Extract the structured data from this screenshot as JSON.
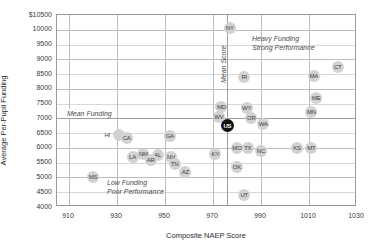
{
  "chart_data": {
    "type": "scatter",
    "title": "",
    "xlabel": "Composite NAEP Score",
    "ylabel": "Average Per-Pupil Funding",
    "xlim": [
      905,
      1030
    ],
    "ylim": [
      4000,
      10500
    ],
    "xticks": [
      910,
      930,
      950,
      970,
      990,
      1010,
      1030
    ],
    "yticks": [
      "$10500",
      "10000",
      "9500",
      "9000",
      "8500",
      "8000",
      "7500",
      "7000",
      "6500",
      "6000",
      "5500",
      "5000",
      "4500",
      "4000"
    ],
    "ytick_values": [
      10500,
      10000,
      9500,
      9000,
      8500,
      8000,
      7500,
      7000,
      6500,
      6000,
      5500,
      5000,
      4500,
      4000
    ],
    "grid": true,
    "legend": "none",
    "mean_funding": 7000,
    "mean_score": 976,
    "annotations": [
      {
        "name": "mean-funding-label",
        "text": "Mean Funding",
        "orientation": "horizontal"
      },
      {
        "name": "mean-score-label",
        "text": "Mean Score",
        "orientation": "vertical"
      },
      {
        "name": "heavy-funding-label",
        "text": "Heavy Funding",
        "orientation": "horizontal"
      },
      {
        "name": "strong-performance-label",
        "text": "Strong Performance",
        "orientation": "horizontal"
      },
      {
        "name": "low-funding-label",
        "text": "Low Funding",
        "orientation": "horizontal"
      },
      {
        "name": "poor-performance-label",
        "text": "Poor Performance",
        "orientation": "horizontal"
      }
    ],
    "points": [
      {
        "label": "NY",
        "x": 977.0,
        "y": 10050,
        "highlight": false,
        "anchor": "center"
      },
      {
        "label": "CT",
        "x": 1022.0,
        "y": 8750,
        "highlight": false,
        "anchor": "center"
      },
      {
        "label": "MA",
        "x": 1012.0,
        "y": 8450,
        "highlight": false,
        "anchor": "center"
      },
      {
        "label": "RI",
        "x": 983.0,
        "y": 8400,
        "highlight": false,
        "anchor": "center"
      },
      {
        "label": "ME",
        "x": 1013.0,
        "y": 7700,
        "highlight": false,
        "anchor": "center"
      },
      {
        "label": "MD",
        "x": 973.5,
        "y": 7400,
        "highlight": false,
        "anchor": "center"
      },
      {
        "label": "WY",
        "x": 984.0,
        "y": 7350,
        "highlight": false,
        "anchor": "center"
      },
      {
        "label": "MN",
        "x": 1011.0,
        "y": 7200,
        "highlight": false,
        "anchor": "center"
      },
      {
        "label": "WV",
        "x": 972.5,
        "y": 7050,
        "highlight": false,
        "anchor": "center"
      },
      {
        "label": "OR",
        "x": 986.0,
        "y": 7000,
        "highlight": false,
        "anchor": "center"
      },
      {
        "label": "US",
        "x": 976.0,
        "y": 6750,
        "highlight": true,
        "anchor": "center"
      },
      {
        "label": "WA",
        "x": 991.0,
        "y": 6800,
        "highlight": false,
        "anchor": "center"
      },
      {
        "label": "HI",
        "x": 931.0,
        "y": 6450,
        "highlight": false,
        "anchor": "left"
      },
      {
        "label": "CA",
        "x": 934.0,
        "y": 6350,
        "highlight": false,
        "anchor": "center"
      },
      {
        "label": "GA",
        "x": 952.0,
        "y": 6400,
        "highlight": false,
        "anchor": "center"
      },
      {
        "label": "MO",
        "x": 980.0,
        "y": 6000,
        "highlight": false,
        "anchor": "center"
      },
      {
        "label": "TX",
        "x": 984.5,
        "y": 6000,
        "highlight": false,
        "anchor": "center"
      },
      {
        "label": "NC",
        "x": 990.0,
        "y": 5900,
        "highlight": false,
        "anchor": "center"
      },
      {
        "label": "KS",
        "x": 1005.0,
        "y": 6000,
        "highlight": false,
        "anchor": "center"
      },
      {
        "label": "MT",
        "x": 1011.0,
        "y": 6000,
        "highlight": false,
        "anchor": "center"
      },
      {
        "label": "KY",
        "x": 971.0,
        "y": 5800,
        "highlight": false,
        "anchor": "center"
      },
      {
        "label": "NM",
        "x": 941.0,
        "y": 5800,
        "highlight": false,
        "anchor": "center"
      },
      {
        "label": "LA",
        "x": 936.5,
        "y": 5700,
        "highlight": false,
        "anchor": "center"
      },
      {
        "label": "AL",
        "x": 947.0,
        "y": 5750,
        "highlight": false,
        "anchor": "center"
      },
      {
        "label": "AR",
        "x": 944.0,
        "y": 5600,
        "highlight": false,
        "anchor": "center"
      },
      {
        "label": "NV",
        "x": 952.5,
        "y": 5700,
        "highlight": false,
        "anchor": "center"
      },
      {
        "label": "TN",
        "x": 954.0,
        "y": 5450,
        "highlight": false,
        "anchor": "center"
      },
      {
        "label": "AZ",
        "x": 958.5,
        "y": 5200,
        "highlight": false,
        "anchor": "center"
      },
      {
        "label": "OK",
        "x": 980.0,
        "y": 5350,
        "highlight": false,
        "anchor": "center"
      },
      {
        "label": "MS",
        "x": 920.0,
        "y": 5000,
        "highlight": false,
        "anchor": "center"
      },
      {
        "label": "UT",
        "x": 983.0,
        "y": 4400,
        "highlight": false,
        "anchor": "center"
      }
    ]
  },
  "colors": {
    "marker": "#d2d2d2",
    "marker_highlight": "#111111",
    "grid": "#d8d8d8",
    "grid_major": "#bdbdbd",
    "axis": "#9a9a9a",
    "text": "#3a3a3a",
    "annotation": "#4a4a4a"
  }
}
